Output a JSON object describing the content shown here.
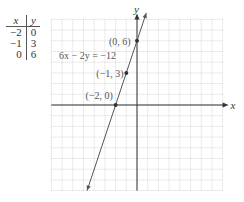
{
  "table": {
    "headers": [
      "x",
      "y"
    ],
    "rows": [
      [
        "−2",
        "0"
      ],
      [
        "−1",
        "3"
      ],
      [
        "0",
        "6"
      ]
    ]
  },
  "graph": {
    "x_axis_label": "x",
    "y_axis_label": "y",
    "equation_label": "6x − 2y = −12",
    "points": [
      {
        "label": "(0, 6)",
        "x": 0,
        "y": 6
      },
      {
        "label": "(−1, 3)",
        "x": -1,
        "y": 3
      },
      {
        "label": "(−2, 0)",
        "x": -2,
        "y": 0
      }
    ],
    "line": {
      "slope": 3,
      "intercept": 6
    },
    "grid_range": {
      "xmin": -8,
      "xmax": 8,
      "ymin": -8,
      "ymax": 8
    },
    "colors": {
      "axis": "#333333",
      "grid": "#bbbbbb",
      "line": "#555555",
      "text": "#555555"
    }
  }
}
